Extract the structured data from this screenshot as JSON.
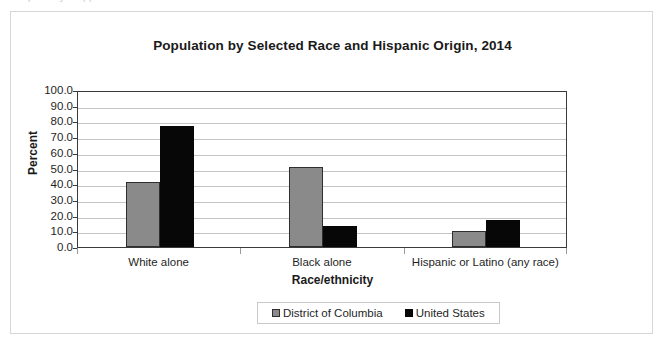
{
  "ghost_text": "partially cropped text line above chart",
  "chart_data": {
    "type": "bar",
    "title": "Population by Selected Race and Hispanic Origin, 2014",
    "xlabel": "Race/ethnicity",
    "ylabel": "Percent",
    "categories": [
      "White alone",
      "Black alone",
      "Hispanic or Latino (any race)"
    ],
    "series": [
      {
        "name": "District of Columbia",
        "color": "#8a8a8a",
        "values": [
          41.5,
          50.9,
          10.3
        ]
      },
      {
        "name": "United States",
        "color": "#070707",
        "values": [
          77.4,
          13.2,
          17.3
        ]
      }
    ],
    "ylim": [
      0,
      100
    ],
    "ytick_step": 10,
    "ytick_labels": [
      "100.0",
      "90.0",
      "80.0",
      "70.0",
      "60.0",
      "50.0",
      "40.0",
      "30.0",
      "20.0",
      "10.0",
      "0.0"
    ],
    "grid": true,
    "legend_position": "bottom"
  }
}
